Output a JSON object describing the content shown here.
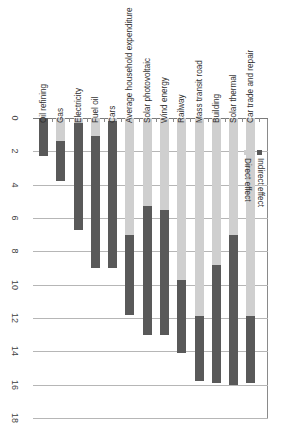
{
  "chart_data": {
    "type": "bar",
    "subtype": "stacked-horizontal-rotated",
    "title": "",
    "xlabel": "",
    "ylabel": "",
    "ylim": [
      0,
      18
    ],
    "ticks": [
      0,
      2,
      4,
      6,
      8,
      10,
      12,
      14,
      16,
      18
    ],
    "grid": true,
    "legend_position": "right",
    "orientation": "rotated-90-clockwise",
    "categories": [
      "Oil refining",
      "Gas",
      "Electricity",
      "Fuel oil",
      "Cars",
      "Average household expenditure",
      "Solar photovoltaic",
      "Wind energy",
      "Railway",
      "Mass transit road",
      "Building",
      "Solar thermal",
      "Car trade and repair"
    ],
    "series": [
      {
        "name": "Direct effect",
        "color": "#cfcfcf",
        "values": [
          0.0,
          1.4,
          0.3,
          1.1,
          0.2,
          7.0,
          5.3,
          5.5,
          9.7,
          11.9,
          8.8,
          7.0,
          11.9
        ]
      },
      {
        "name": "Indirect effect",
        "color": "#595959",
        "values": [
          2.3,
          2.4,
          6.4,
          7.9,
          8.8,
          4.8,
          7.7,
          7.5,
          4.4,
          3.9,
          7.1,
          9.0,
          4.0
        ]
      }
    ],
    "totals": [
      2.3,
      3.8,
      6.7,
      9.0,
      9.0,
      11.8,
      13.0,
      13.0,
      14.1,
      15.8,
      15.9,
      16.0,
      15.9
    ]
  },
  "legend": {
    "items": [
      {
        "label": "Direct effect",
        "swatch": "direct-swatch-icon"
      },
      {
        "label": "Indirect effect",
        "swatch": "indirect-swatch-icon"
      }
    ]
  },
  "axis": {
    "tick_labels": [
      "0",
      "2",
      "4",
      "6",
      "8",
      "10",
      "12",
      "14",
      "16",
      "18"
    ]
  }
}
